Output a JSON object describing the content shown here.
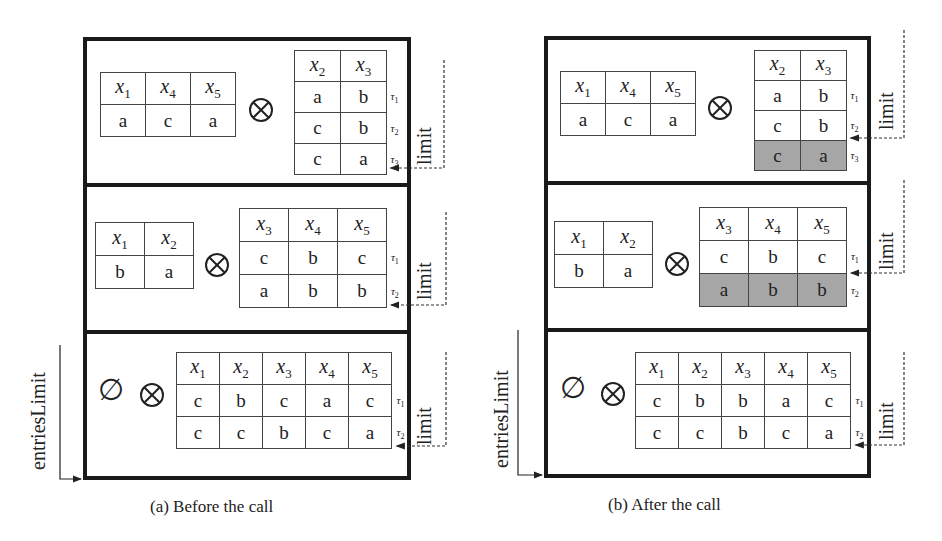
{
  "figure": {
    "panels": [
      {
        "caption": "(a) Before the call",
        "side_label": "entriesLimit",
        "rows": [
          {
            "left": {
              "headers": [
                "x1",
                "x4",
                "x5"
              ],
              "rows": [
                [
                  "a",
                  "c",
                  "a"
                ]
              ]
            },
            "operator": "⊗",
            "right": {
              "headers": [
                "x2",
                "x3"
              ],
              "rows": [
                [
                  "a",
                  "b"
                ],
                [
                  "c",
                  "b"
                ],
                [
                  "c",
                  "a"
                ]
              ],
              "tuple_labels": [
                "τ1",
                "τ2",
                "τ3"
              ],
              "shaded_rows": []
            },
            "limit_label": "limit"
          },
          {
            "left": {
              "headers": [
                "x1",
                "x2"
              ],
              "rows": [
                [
                  "b",
                  "a"
                ]
              ]
            },
            "operator": "⊗",
            "right": {
              "headers": [
                "x3",
                "x4",
                "x5"
              ],
              "rows": [
                [
                  "c",
                  "b",
                  "c"
                ],
                [
                  "a",
                  "b",
                  "b"
                ]
              ],
              "tuple_labels": [
                "τ1",
                "τ2"
              ],
              "shaded_rows": []
            },
            "limit_label": "limit"
          },
          {
            "left_symbol": "∅",
            "operator": "⊗",
            "right": {
              "headers": [
                "x1",
                "x2",
                "x3",
                "x4",
                "x5"
              ],
              "rows": [
                [
                  "c",
                  "b",
                  "c",
                  "a",
                  "c"
                ],
                [
                  "c",
                  "c",
                  "b",
                  "c",
                  "a"
                ]
              ],
              "tuple_labels": [
                "τ1",
                "τ2"
              ],
              "shaded_rows": []
            },
            "limit_label": "limit"
          }
        ]
      },
      {
        "caption": "(b) After the call",
        "side_label": "entriesLimit",
        "rows": [
          {
            "left": {
              "headers": [
                "x1",
                "x4",
                "x5"
              ],
              "rows": [
                [
                  "a",
                  "c",
                  "a"
                ]
              ]
            },
            "operator": "⊗",
            "right": {
              "headers": [
                "x2",
                "x3"
              ],
              "rows": [
                [
                  "a",
                  "b"
                ],
                [
                  "c",
                  "b"
                ],
                [
                  "c",
                  "a"
                ]
              ],
              "tuple_labels": [
                "τ1",
                "τ2",
                "τ3"
              ],
              "shaded_rows": [
                2
              ]
            },
            "limit_label": "limit"
          },
          {
            "left": {
              "headers": [
                "x1",
                "x2"
              ],
              "rows": [
                [
                  "b",
                  "a"
                ]
              ]
            },
            "operator": "⊗",
            "right": {
              "headers": [
                "x3",
                "x4",
                "x5"
              ],
              "rows": [
                [
                  "c",
                  "b",
                  "c"
                ],
                [
                  "a",
                  "b",
                  "b"
                ]
              ],
              "tuple_labels": [
                "τ1",
                "τ2"
              ],
              "shaded_rows": [
                1
              ]
            },
            "limit_label": "limit"
          },
          {
            "left_symbol": "∅",
            "operator": "⊗",
            "right": {
              "headers": [
                "x1",
                "x2",
                "x3",
                "x4",
                "x5"
              ],
              "rows": [
                [
                  "c",
                  "b",
                  "b",
                  "a",
                  "c"
                ],
                [
                  "c",
                  "c",
                  "b",
                  "c",
                  "a"
                ]
              ],
              "tuple_labels": [
                "τ1",
                "τ2"
              ],
              "shaded_rows": []
            },
            "limit_label": "limit"
          }
        ]
      }
    ],
    "colors": {
      "border": "#1a1a1a",
      "shaded": "#a6a6a6",
      "grid": "#444444"
    }
  }
}
